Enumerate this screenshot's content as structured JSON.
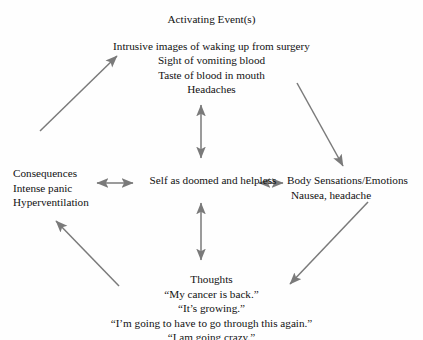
{
  "diagram": {
    "type": "cbt-cross-sectional-formulation",
    "arrow_color": "#7a7a7a",
    "text_color": "#111111",
    "background_color": "#fefefe",
    "nodes": {
      "activating": {
        "title": "Activating Event(s)",
        "lines": [
          "Intrusive images of waking up from surgery",
          "Sight of vomiting blood",
          "Taste of blood in mouth",
          "Headaches"
        ]
      },
      "consequences": {
        "title": "Consequences",
        "lines": [
          "Intense panic",
          "Hyperventilation"
        ]
      },
      "core_belief": {
        "title": "Self as doomed and helpless"
      },
      "body": {
        "title": "Body Sensations/Emotions",
        "lines": [
          "Nausea, headache"
        ]
      },
      "thoughts": {
        "title": "Thoughts",
        "lines": [
          "“My cancer is back.”",
          "“It’s growing.”",
          "“I’m going to have to go through this again.”",
          "“I am going crazy.”"
        ]
      }
    },
    "connectors": [
      {
        "name": "consequences-to-activating",
        "style": "single-headed",
        "direction": "up-right",
        "from": "consequences",
        "to": "activating"
      },
      {
        "name": "activating-to-body",
        "style": "single-headed",
        "direction": "down-right",
        "from": "activating",
        "to": "body"
      },
      {
        "name": "body-to-thoughts",
        "style": "single-headed",
        "direction": "down-left",
        "from": "body",
        "to": "thoughts"
      },
      {
        "name": "thoughts-to-consequences",
        "style": "single-headed",
        "direction": "up-left",
        "from": "thoughts",
        "to": "consequences"
      },
      {
        "name": "consequences-core-belief",
        "style": "double-headed",
        "direction": "horizontal",
        "from": "consequences",
        "to": "core_belief"
      },
      {
        "name": "core-belief-body",
        "style": "double-headed",
        "direction": "horizontal",
        "from": "core_belief",
        "to": "body"
      },
      {
        "name": "activating-core-belief",
        "style": "double-headed",
        "direction": "vertical",
        "from": "activating",
        "to": "core_belief"
      },
      {
        "name": "core-belief-thoughts",
        "style": "double-headed",
        "direction": "vertical",
        "from": "core_belief",
        "to": "thoughts"
      }
    ]
  }
}
